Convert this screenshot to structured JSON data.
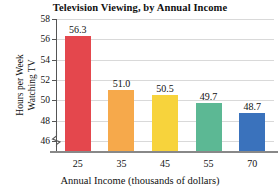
{
  "chart_data": {
    "type": "bar",
    "title": "Television Viewing, by Annual Income",
    "xlabel": "Annual Income (thousands of dollars)",
    "ylabel": "Hours per Week Watching TV",
    "ylabel_lines": [
      "Hours per Week",
      "Watching TV"
    ],
    "categories": [
      "25",
      "35",
      "45",
      "55",
      "70"
    ],
    "values": [
      56.3,
      51.0,
      50.5,
      49.7,
      48.7
    ],
    "value_labels": [
      "56.3",
      "51.0",
      "50.5",
      "49.7",
      "48.7"
    ],
    "colors": [
      "#e4474d",
      "#f6a94b",
      "#f7d33c",
      "#5cb894",
      "#3a72bc"
    ],
    "ylim": [
      45.0,
      58.0
    ],
    "yticks": [
      46,
      48,
      50,
      52,
      54,
      56,
      58
    ],
    "ytick_labels": [
      "46",
      "48",
      "50",
      "52",
      "54",
      "56",
      "58"
    ],
    "grid": true,
    "legend": "none",
    "axis_break": true,
    "gridline_color": "#d9d9d9",
    "axis_color": "#555555"
  }
}
